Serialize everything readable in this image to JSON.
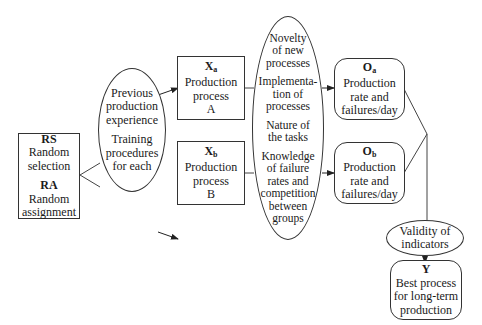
{
  "diagram": {
    "random_box": {
      "groups": [
        {
          "code": "RS",
          "label": "Random selection",
          "lines": [
            "Random",
            "selection"
          ]
        },
        {
          "code": "RA",
          "label": "Random assignment",
          "lines": [
            "Random",
            "assignment"
          ]
        }
      ]
    },
    "prior_ellipse": {
      "groups": [
        {
          "lines": [
            "Previous",
            "production",
            "experience"
          ]
        },
        {
          "lines": [
            "Training",
            "procedures",
            "for each"
          ]
        }
      ]
    },
    "process_a": {
      "code": "X",
      "sub": "a",
      "lines": [
        "Production",
        "process",
        "A"
      ]
    },
    "process_b": {
      "code": "X",
      "sub": "b",
      "lines": [
        "Production",
        "process",
        "B"
      ]
    },
    "threats_ellipse": {
      "groups": [
        {
          "lines": [
            "Novelty",
            "of new",
            "processes"
          ]
        },
        {
          "lines": [
            "Implementa-",
            "tion of",
            "processes"
          ]
        },
        {
          "lines": [
            "Nature of",
            "the tasks"
          ]
        },
        {
          "lines": [
            "Knowledge",
            "of failure",
            "rates and",
            "competition",
            "between",
            "groups"
          ]
        }
      ]
    },
    "outcome_a": {
      "code": "O",
      "sub": "a",
      "lines": [
        "Production",
        "rate and",
        "failures/day"
      ]
    },
    "outcome_b": {
      "code": "O",
      "sub": "b",
      "lines": [
        "Production",
        "rate and",
        "failures/day"
      ]
    },
    "validity": {
      "lines": [
        "Validity of",
        "indicators"
      ]
    },
    "result": {
      "code": "Y",
      "lines": [
        "Best process",
        "for long-term",
        "production"
      ]
    }
  }
}
